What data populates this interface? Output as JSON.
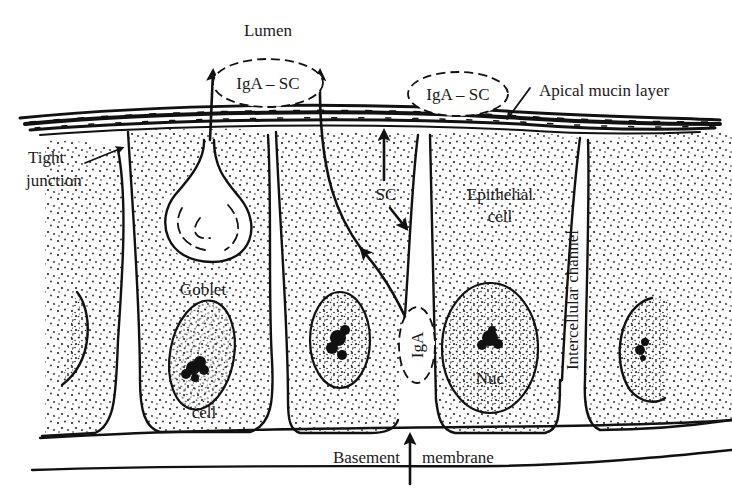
{
  "labels": {
    "lumen": "Lumen",
    "iga_sc_1": "IgA – SC",
    "iga_sc_2": "IgA – SC",
    "apical_mucin_layer": "Apical mucin layer",
    "tight_junction_line1": "Tight",
    "tight_junction_line2": "junction",
    "sc": "SC",
    "epithelial_line1": "Epithelial",
    "epithelial_line2": "cell",
    "goblet_line1": "Goblet",
    "goblet_line2": "cell",
    "iga": "IgA",
    "nuc": "Nuc",
    "intercellular_channel": "Intercellular channel",
    "basement_left": "Basement",
    "basement_right": "membrane"
  },
  "colors": {
    "ink": "#111111",
    "background": "#ffffff"
  },
  "structures": {
    "cells": [
      "partial-left-cell",
      "goblet-cell",
      "iga-transport-cell",
      "epithelial-cell",
      "partial-right-cell"
    ],
    "pathways": [
      "IgA enters from basement membrane",
      "IgA transcytosis through cell",
      "SC secreted apically",
      "IgA-SC released into lumen",
      "Goblet cell mucin secretion"
    ]
  }
}
